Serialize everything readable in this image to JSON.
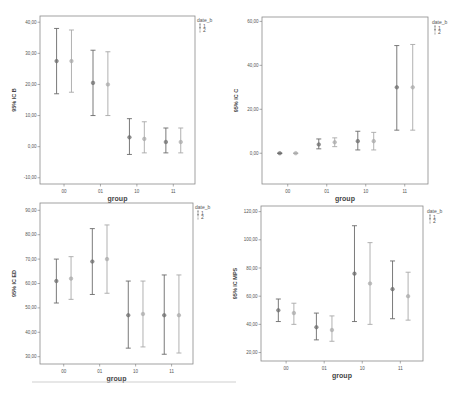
{
  "chart_data": [
    {
      "type": "errorbar",
      "title": "",
      "xlabel": "group",
      "ylabel": "95% IC B",
      "categories": [
        "00",
        "01",
        "10",
        "11"
      ],
      "yticks": [
        "-10,00",
        "0,00",
        "10,00",
        "20,00",
        "30,00",
        "40,00"
      ],
      "ytick_values": [
        -10,
        0,
        10,
        20,
        30,
        40
      ],
      "ylim": [
        -12,
        42
      ],
      "legend": {
        "title": "date_b",
        "entries": [
          "1",
          "2"
        ],
        "position": "top-right"
      },
      "series": [
        {
          "name": "1",
          "color": "#6b6b6b",
          "mean": [
            27.5,
            20.5,
            3,
            1.5
          ],
          "lower": [
            17,
            10,
            -2.5,
            -2
          ],
          "upper": [
            38,
            31,
            9,
            6
          ]
        },
        {
          "name": "2",
          "color": "#a8a8a8",
          "mean": [
            27.5,
            20,
            2.5,
            1.5
          ],
          "lower": [
            17.5,
            10,
            -2,
            -2
          ],
          "upper": [
            37.5,
            30.5,
            8,
            6
          ]
        }
      ]
    },
    {
      "type": "errorbar",
      "title": "",
      "xlabel": "group",
      "ylabel": "95% IC C",
      "categories": [
        "00",
        "01",
        "10",
        "11"
      ],
      "yticks": [
        "0,00",
        "20,00",
        "40,00",
        "60,00"
      ],
      "ytick_values": [
        0,
        20,
        40,
        60
      ],
      "ylim": [
        -14,
        62
      ],
      "legend": {
        "title": "date_b",
        "entries": [
          "1",
          "2"
        ],
        "position": "top-right"
      },
      "series": [
        {
          "name": "1",
          "color": "#6b6b6b",
          "mean": [
            0,
            4,
            5.5,
            30
          ],
          "lower": [
            0,
            2,
            1.5,
            10.5
          ],
          "upper": [
            0,
            6.5,
            10,
            49
          ]
        },
        {
          "name": "2",
          "color": "#a8a8a8",
          "mean": [
            0,
            5,
            5.5,
            30
          ],
          "lower": [
            0,
            3,
            1.5,
            10.5
          ],
          "upper": [
            0,
            7,
            9.5,
            49.5
          ]
        }
      ]
    },
    {
      "type": "errorbar",
      "title": "",
      "xlabel": "group",
      "ylabel": "95% IC ED",
      "categories": [
        "00",
        "01",
        "10",
        "11"
      ],
      "yticks": [
        "30,00",
        "40,00",
        "50,00",
        "60,00",
        "70,00",
        "80,00",
        "90,00"
      ],
      "ytick_values": [
        30,
        40,
        50,
        60,
        70,
        80,
        90
      ],
      "ylim": [
        27,
        93
      ],
      "legend": {
        "title": "date_b",
        "entries": [
          "1",
          "2"
        ],
        "position": "top-right"
      },
      "series": [
        {
          "name": "1",
          "color": "#6b6b6b",
          "mean": [
            61,
            69,
            47,
            47
          ],
          "lower": [
            52,
            55.5,
            33.5,
            31
          ],
          "upper": [
            70,
            82.5,
            61,
            63.5
          ]
        },
        {
          "name": "2",
          "color": "#a8a8a8",
          "mean": [
            62,
            70,
            47.5,
            47
          ],
          "lower": [
            53.5,
            56,
            34,
            31.5
          ],
          "upper": [
            71,
            84,
            61,
            63.5
          ]
        }
      ]
    },
    {
      "type": "errorbar",
      "title": "",
      "xlabel": "group",
      "ylabel": "95% IC MPS",
      "categories": [
        "00",
        "01",
        "10",
        "11"
      ],
      "yticks": [
        "20,00",
        "40,00",
        "60,00",
        "80,00",
        "100,00",
        "120,00"
      ],
      "ytick_values": [
        20,
        40,
        60,
        80,
        100,
        120
      ],
      "ylim": [
        14,
        124
      ],
      "legend": {
        "title": "date_b",
        "entries": [
          "1",
          "2"
        ],
        "position": "top-right"
      },
      "series": [
        {
          "name": "1",
          "color": "#6b6b6b",
          "mean": [
            50,
            38,
            76,
            65
          ],
          "lower": [
            42,
            29,
            42,
            44
          ],
          "upper": [
            58,
            48,
            110,
            85
          ]
        },
        {
          "name": "2",
          "color": "#a8a8a8",
          "mean": [
            48,
            36,
            69,
            60
          ],
          "lower": [
            40,
            28,
            40,
            43
          ],
          "upper": [
            55,
            46,
            98,
            77
          ]
        }
      ]
    }
  ]
}
